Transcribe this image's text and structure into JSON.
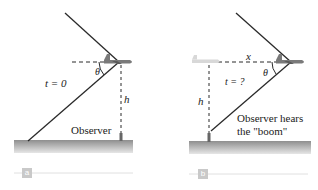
{
  "panel_a": {
    "tag": "a",
    "time_label": "t = 0",
    "angle_label": "θ",
    "height_label": "h",
    "observer_label": "Observer"
  },
  "panel_b": {
    "tag": "b",
    "time_label": "t = ?",
    "angle_label": "θ",
    "height_label": "h",
    "distance_label": "x",
    "observer_label_line1": "Observer hears",
    "observer_label_line2": "the \"boom\""
  },
  "colors": {
    "line": "#2a2a2a",
    "ground": "#9a9a9a",
    "plane": "#7a7a7a",
    "ghost_plane": "#d8d8d8",
    "tag": "#c9c9c9"
  }
}
